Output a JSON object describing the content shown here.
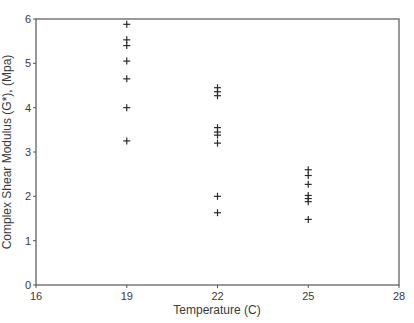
{
  "chart_data": {
    "type": "scatter",
    "title": "",
    "xlabel": "Temperature (C)",
    "ylabel": "Complex Shear Modulus (G*), (Mpa)",
    "xlim": [
      16,
      28
    ],
    "ylim": [
      0,
      6
    ],
    "xticks": [
      16,
      19,
      22,
      25,
      28
    ],
    "yticks": [
      0,
      1,
      2,
      3,
      4,
      5,
      6
    ],
    "grid": false,
    "legend": null,
    "marker": "+",
    "series": [
      {
        "name": "G*",
        "points": [
          {
            "x": 19,
            "y": 5.88
          },
          {
            "x": 19,
            "y": 5.53
          },
          {
            "x": 19,
            "y": 5.4
          },
          {
            "x": 19,
            "y": 5.05
          },
          {
            "x": 19,
            "y": 4.65
          },
          {
            "x": 19,
            "y": 4.0
          },
          {
            "x": 19,
            "y": 3.25
          },
          {
            "x": 22,
            "y": 4.45
          },
          {
            "x": 22,
            "y": 4.36
          },
          {
            "x": 22,
            "y": 4.27
          },
          {
            "x": 22,
            "y": 3.55
          },
          {
            "x": 22,
            "y": 3.45
          },
          {
            "x": 22,
            "y": 3.38
          },
          {
            "x": 22,
            "y": 3.2
          },
          {
            "x": 22,
            "y": 2.0
          },
          {
            "x": 22,
            "y": 1.63
          },
          {
            "x": 25,
            "y": 2.6
          },
          {
            "x": 25,
            "y": 2.47
          },
          {
            "x": 25,
            "y": 2.27
          },
          {
            "x": 25,
            "y": 2.02
          },
          {
            "x": 25,
            "y": 1.95
          },
          {
            "x": 25,
            "y": 1.88
          },
          {
            "x": 25,
            "y": 1.48
          }
        ]
      }
    ]
  },
  "colors": {
    "axis": "#555555",
    "marker": "#2a2a2a",
    "text": "#3a3a3a"
  }
}
